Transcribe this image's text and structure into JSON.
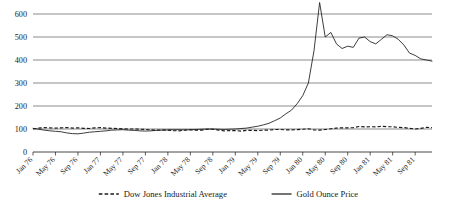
{
  "chart_data": {
    "type": "line",
    "title": "",
    "subtitle": "",
    "xlabel": "",
    "ylabel": "",
    "ylim": [
      0,
      600
    ],
    "yticks": [
      0,
      100,
      200,
      300,
      400,
      500,
      600
    ],
    "grid": true,
    "legend_position": "bottom",
    "x_tick_labels": [
      "Jan 76",
      "May 76",
      "Sep 76",
      "Jan 77",
      "May 77",
      "Sep 77",
      "Jan 78",
      "May 78",
      "Sep 78",
      "Jan 79",
      "May 79",
      "Sep 79",
      "Jan 80",
      "May 80",
      "Sep 80",
      "Jan 81",
      "May 81",
      "Sep 81"
    ],
    "x_tick_indices": [
      0,
      4,
      8,
      12,
      16,
      20,
      24,
      28,
      32,
      36,
      40,
      44,
      48,
      52,
      56,
      60,
      64,
      68
    ],
    "x": [
      "Jan 76",
      "Feb 76",
      "Mar 76",
      "Apr 76",
      "May 76",
      "Jun 76",
      "Jul 76",
      "Aug 76",
      "Sep 76",
      "Oct 76",
      "Nov 76",
      "Dec 76",
      "Jan 77",
      "Feb 77",
      "Mar 77",
      "Apr 77",
      "May 77",
      "Jun 77",
      "Jul 77",
      "Aug 77",
      "Sep 77",
      "Oct 77",
      "Nov 77",
      "Dec 77",
      "Jan 78",
      "Feb 78",
      "Mar 78",
      "Apr 78",
      "May 78",
      "Jun 78",
      "Jul 78",
      "Aug 78",
      "Sep 78",
      "Oct 78",
      "Nov 78",
      "Dec 78",
      "Jan 79",
      "Feb 79",
      "Mar 79",
      "Apr 79",
      "May 79",
      "Jun 79",
      "Jul 79",
      "Aug 79",
      "Sep 79",
      "Oct 79",
      "Nov 79",
      "Dec 79",
      "Jan 80",
      "Feb 80",
      "Mar 80",
      "Apr 80",
      "May 80",
      "Jun 80",
      "Jul 80",
      "Aug 80",
      "Sep 80",
      "Oct 80",
      "Nov 80",
      "Dec 80",
      "Jan 81",
      "Feb 81",
      "Mar 81",
      "Apr 81",
      "May 81",
      "Jun 81",
      "Jul 81",
      "Aug 81",
      "Sep 81",
      "Oct 81",
      "Nov 81",
      "Dec 81"
    ],
    "series": [
      {
        "name": "Gold Ounce Price",
        "style": "solid",
        "color": "#1a1a1a",
        "values": [
          103,
          99,
          95,
          92,
          90,
          88,
          83,
          80,
          79,
          82,
          86,
          88,
          90,
          92,
          95,
          96,
          97,
          95,
          94,
          92,
          91,
          92,
          94,
          95,
          96,
          97,
          97,
          96,
          97,
          98,
          99,
          100,
          100,
          99,
          98,
          99,
          100,
          102,
          104,
          108,
          112,
          118,
          125,
          136,
          148,
          166,
          182,
          210,
          245,
          300,
          440,
          650,
          500,
          520,
          470,
          450,
          460,
          455,
          495,
          500,
          480,
          470,
          490,
          510,
          505,
          490,
          465,
          430,
          420,
          405,
          400,
          395
        ]
      },
      {
        "name": "Dow Jones Industrial Average",
        "style": "dashed",
        "color": "#1a1a1a",
        "values": [
          100,
          104,
          106,
          105,
          104,
          105,
          106,
          104,
          105,
          103,
          102,
          105,
          106,
          104,
          103,
          102,
          101,
          100,
          100,
          99,
          98,
          96,
          95,
          96,
          95,
          93,
          92,
          95,
          96,
          95,
          95,
          99,
          99,
          95,
          92,
          93,
          93,
          91,
          94,
          94,
          93,
          95,
          95,
          98,
          98,
          96,
          96,
          97,
          99,
          101,
          96,
          95,
          98,
          101,
          104,
          105,
          105,
          106,
          111,
          109,
          110,
          109,
          112,
          110,
          110,
          107,
          106,
          103,
          100,
          103,
          107,
          106
        ]
      }
    ],
    "legend": [
      {
        "label": "Dow Jones Industrial Average",
        "marker": "dashed-line"
      },
      {
        "label": "Gold Ounce Price",
        "marker": "solid-line"
      }
    ]
  }
}
